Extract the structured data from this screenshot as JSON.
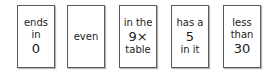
{
  "cards": [
    {
      "lines": [
        "ends",
        "in",
        "0"
      ],
      "big": [
        false,
        false,
        true
      ]
    },
    {
      "lines": [
        "even"
      ],
      "big": [
        false
      ]
    },
    {
      "lines": [
        "in the",
        "9×",
        "table"
      ],
      "big": [
        false,
        true,
        false
      ]
    },
    {
      "lines": [
        "has a",
        "5",
        "in it"
      ],
      "big": [
        false,
        true,
        false
      ]
    },
    {
      "lines": [
        "less",
        "than",
        "30"
      ],
      "big": [
        false,
        false,
        true
      ]
    }
  ]
}
